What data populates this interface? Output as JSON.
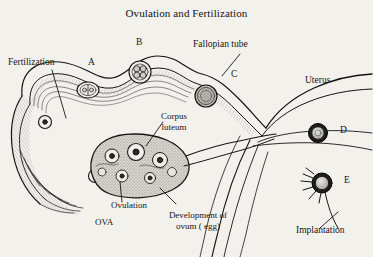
{
  "figure": {
    "title": "Ovulation and Fertilization",
    "background_color": "#f3f1ec",
    "ink_color": "#141414"
  },
  "labels": {
    "fertilization": "Fertilization",
    "fallopian_tube": "Fallopian tube",
    "uterus": "Uterus",
    "corpus_luteum_line1": "Corpus",
    "corpus_luteum_line2": "luteum",
    "ovulation": "Ovulation",
    "ova": "OVA",
    "development_line1": "Development of",
    "development_line2": "ovum ( egg)",
    "implantation": "Implantation"
  },
  "stage_markers": [
    {
      "letter": "A",
      "meaning": "fertilized-ovum-in-tube"
    },
    {
      "letter": "B",
      "meaning": "four-cell-embryo"
    },
    {
      "letter": "C",
      "meaning": "morula"
    },
    {
      "letter": "D",
      "meaning": "blastocyst-in-uterus"
    },
    {
      "letter": "E",
      "meaning": "implanting-blastocyst"
    }
  ]
}
